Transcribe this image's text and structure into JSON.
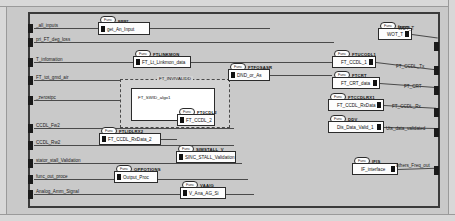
{
  "diagram": {
    "title": "FT",
    "type": "simulink-block-diagram",
    "canvas": {
      "width": 455,
      "height": 221,
      "background": "#c9c9c9"
    }
  },
  "inputs": [
    {
      "label": "_all_inputs",
      "x": 30,
      "y": 24
    },
    {
      "label": "pri_FT_deg_loss",
      "x": 30,
      "y": 38
    },
    {
      "label": "T_infomation",
      "x": 30,
      "y": 58
    },
    {
      "label": "FT_tot_gmd_air",
      "x": 30,
      "y": 76
    },
    {
      "label": "_zerostpc",
      "x": 30,
      "y": 96
    },
    {
      "label": "CCDL_Fw2",
      "x": 30,
      "y": 124
    },
    {
      "label": "CCDL_Rw2",
      "x": 30,
      "y": 141
    },
    {
      "label": "stator_stall_Validation",
      "x": 30,
      "y": 159
    },
    {
      "label": "func_out_proce",
      "x": 30,
      "y": 175
    },
    {
      "label": "Analog_Amm_Signal",
      "x": 30,
      "y": 190
    }
  ],
  "outputs": [
    {
      "label": "WOT_T",
      "x": 398,
      "y": 36
    },
    {
      "label": "FT_CCDL_Tx",
      "x": 398,
      "y": 72
    },
    {
      "label": "FT_CRT",
      "x": 398,
      "y": 90
    },
    {
      "label": "FT_CCDL_Rx",
      "x": 398,
      "y": 108
    },
    {
      "label": "Uts_data_validated",
      "x": 388,
      "y": 126
    },
    {
      "label": "others_Freq_out",
      "x": 392,
      "y": 165
    }
  ],
  "blocks": [
    {
      "name": "get_An_Input",
      "tag": "pawr",
      "balloon": "Func",
      "x": 98,
      "y": 22,
      "w": 52,
      "h": 13
    },
    {
      "name": "FT_Lt_Linkmon_data",
      "tag": "FTLINKMON",
      "balloon": "Func",
      "x": 133,
      "y": 56,
      "w": 58,
      "h": 12
    },
    {
      "name": "FT_CCDL_2",
      "tag": "FT0CDL2",
      "balloon": "Func",
      "x": 177,
      "y": 114,
      "w": 38,
      "h": 12
    },
    {
      "name": "FT_CCDL_RxData_2",
      "tag": "FTLIDLRX2",
      "balloon": "Func",
      "x": 99,
      "y": 133,
      "w": 62,
      "h": 12
    },
    {
      "name": "Output_Proc",
      "tag": "OPPOTIONS",
      "balloon": "Func",
      "x": 114,
      "y": 171,
      "w": 44,
      "h": 12
    },
    {
      "name": "SINC_STALL_Validation",
      "tag": "SIMSTALL_V",
      "balloon": "Func",
      "x": 176,
      "y": 151,
      "w": 60,
      "h": 12
    },
    {
      "name": "V_Ana_AG_Si",
      "tag": "VAAIG",
      "balloon": "Func",
      "x": 180,
      "y": 187,
      "w": 46,
      "h": 12
    },
    {
      "name": "DND_or_As",
      "tag": "FTFOSASR",
      "balloon": "Func",
      "x": 228,
      "y": 69,
      "w": 42,
      "h": 12
    },
    {
      "name": "WOT_T",
      "tag": "feqec",
      "balloon": "Func",
      "x": 378,
      "y": 28,
      "w": 34,
      "h": 12
    },
    {
      "name": "FT_CCDL_1",
      "tag": "FTUCODL1",
      "balloon": "Func",
      "x": 332,
      "y": 56,
      "w": 44,
      "h": 12
    },
    {
      "name": "FT_CRT_data",
      "tag": "FTCRT",
      "balloon": "Func",
      "x": 332,
      "y": 77,
      "w": 48,
      "h": 12
    },
    {
      "name": "FT_CCDL_RxData",
      "tag": "FTCCDLRX1",
      "balloon": "Func",
      "x": 328,
      "y": 99,
      "w": 56,
      "h": 12
    },
    {
      "name": "Dis_Data_Valid_1",
      "tag": "DDV",
      "balloon": "Func",
      "x": 328,
      "y": 121,
      "w": 56,
      "h": 12
    },
    {
      "name": "IF_interface",
      "tag": "IFIS",
      "balloon": "Func",
      "x": 352,
      "y": 163,
      "w": 46,
      "h": 12
    }
  ],
  "subsystem": {
    "label": "FT_INVIVALIDD",
    "x": 120,
    "y": 79,
    "w": 110,
    "h": 49,
    "inner": {
      "name": "FT_SWID_algo1",
      "x": 10,
      "y": 8,
      "w": 84,
      "h": 33
    }
  }
}
